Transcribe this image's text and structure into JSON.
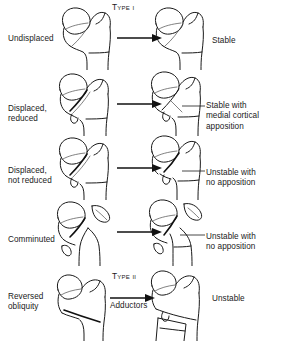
{
  "figure": {
    "background_color": "#ffffff",
    "ink_color": "#1a1a1a"
  },
  "columns": {
    "left_header": "Fracture pattern",
    "right_header": "Stability after reduction"
  },
  "rows": [
    {
      "id": "undisplaced",
      "pattern_label": "Undisplaced",
      "type_caption": "Type I",
      "arrow_caption": "",
      "outcome_label": "Stable",
      "outcome_has_leader": false,
      "fragments": "none",
      "reduced": true
    },
    {
      "id": "displaced-reduced",
      "pattern_label": "Displaced,\nreduced",
      "type_caption": "",
      "arrow_caption": "",
      "outcome_label": "Stable with\nmedial cortical\napposition",
      "outcome_has_leader": true,
      "fragments": "none",
      "reduced": true
    },
    {
      "id": "displaced-not-reduced",
      "pattern_label": "Displaced,\nnot reduced",
      "type_caption": "",
      "arrow_caption": "",
      "outcome_label": "Unstable with\nno apposition",
      "outcome_has_leader": true,
      "fragments": "none",
      "reduced": false
    },
    {
      "id": "comminuted",
      "pattern_label": "Comminuted",
      "type_caption": "",
      "arrow_caption": "",
      "outcome_label": "Unstable with\nno apposition",
      "outcome_has_leader": true,
      "fragments": "greater-trochanter-and-lesser-trochanter",
      "reduced": false
    },
    {
      "id": "reversed-obliquity",
      "pattern_label": "Reversed\nobliquity",
      "type_caption": "Type II",
      "arrow_caption": "Adductors",
      "outcome_label": "Unstable",
      "outcome_has_leader": false,
      "fragments": "none",
      "reduced": false
    }
  ],
  "icons": {
    "arrow": "arrow-right-icon",
    "femur": "proximal-femur-icon",
    "leader": "leader-line-icon"
  }
}
